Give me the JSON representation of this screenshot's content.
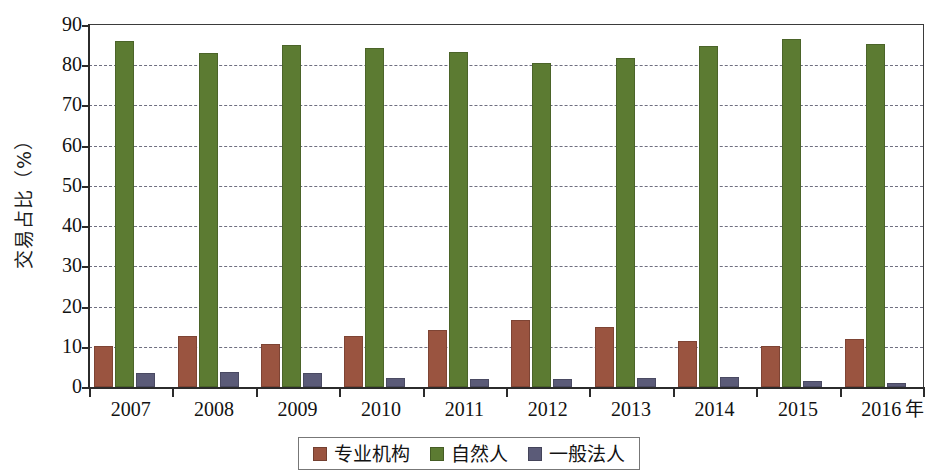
{
  "chart_data": {
    "type": "bar",
    "title": "",
    "subtitle": "",
    "xlabel": "年",
    "ylabel": "交易占比（%）",
    "categories": [
      "2007",
      "2008",
      "2009",
      "2010",
      "2011",
      "2012",
      "2013",
      "2014",
      "2015",
      "2016"
    ],
    "series": [
      {
        "name": "专业机构",
        "color": "#9a5440",
        "values": [
          10.3,
          12.7,
          10.8,
          12.8,
          14.1,
          16.7,
          15.0,
          11.4,
          10.1,
          12.0
        ]
      },
      {
        "name": "自然人",
        "color": "#5c7b32",
        "values": [
          86.0,
          83.0,
          85.0,
          84.3,
          83.3,
          80.6,
          81.9,
          84.8,
          86.5,
          85.2
        ]
      },
      {
        "name": "一般法人",
        "color": "#5b5b78",
        "values": [
          3.5,
          3.8,
          3.6,
          2.2,
          1.9,
          1.9,
          2.2,
          2.6,
          1.6,
          1.0
        ]
      }
    ],
    "ylim": [
      0,
      90
    ],
    "y_ticks": [
      0,
      10,
      20,
      30,
      40,
      50,
      60,
      70,
      80,
      90
    ],
    "grid": true,
    "grid_style": "dashed-horizontal",
    "legend_position": "bottom-center",
    "bar_grouping": "clustered"
  },
  "axis": {
    "y_title": "交易占比（%）",
    "x_unit": "年",
    "tick_labels_y": [
      "90",
      "80",
      "70",
      "60",
      "50",
      "40",
      "30",
      "20",
      "10",
      "0"
    ],
    "tick_labels_x": [
      "2007",
      "2008",
      "2009",
      "2010",
      "2011",
      "2012",
      "2013",
      "2014",
      "2015",
      "2016"
    ]
  },
  "legend": {
    "items": [
      {
        "label": "专业机构",
        "color": "#9a5440"
      },
      {
        "label": "自然人",
        "color": "#5c7b32"
      },
      {
        "label": "一般法人",
        "color": "#5b5b78"
      }
    ]
  }
}
